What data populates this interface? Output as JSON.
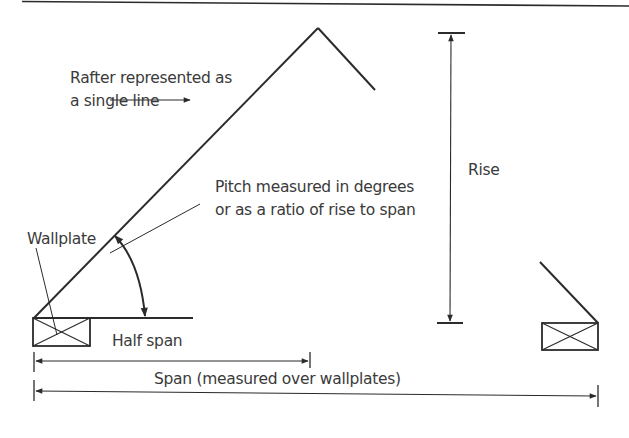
{
  "diagram": {
    "colors": {
      "line": "#2b2b2b",
      "text": "#3a3a3a",
      "background": "#ffffff"
    },
    "labels": {
      "rafter_line1": "Rafter represented as",
      "rafter_line2": "a single line",
      "pitch_line1": "Pitch measured in degrees",
      "pitch_line2": "or as a ratio of rise to span",
      "wallplate": "Wallplate",
      "rise": "Rise",
      "half_span": "Half span",
      "span": "Span (measured over wallplates)"
    },
    "elements": [
      {
        "id": "rafter",
        "type": "line",
        "description": "left rafter from wallplate to apex"
      },
      {
        "id": "apex-right",
        "type": "line",
        "description": "right rafter stub from apex"
      },
      {
        "id": "left-wallplate",
        "type": "box-with-cross"
      },
      {
        "id": "right-wallplate",
        "type": "box-with-cross"
      },
      {
        "id": "pitch-arc",
        "type": "double-arrow-arc"
      },
      {
        "id": "rise-dimension",
        "type": "vertical-dimension"
      },
      {
        "id": "half-span-dimension",
        "type": "horizontal-dimension"
      },
      {
        "id": "span-dimension",
        "type": "horizontal-dimension"
      }
    ]
  }
}
